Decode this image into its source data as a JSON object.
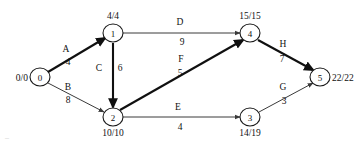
{
  "diagram": {
    "type": "aoa-network",
    "colors": {
      "background": "#ffffff",
      "node_stroke": "#1a1a1a",
      "edge_normal": "#3a3a3a",
      "edge_critical": "#101010",
      "text": "#111111"
    },
    "nodes": [
      {
        "id": "0",
        "label": "0",
        "time": "0/0",
        "cx": 40,
        "cy": 77,
        "r": 9,
        "time_pos": "left"
      },
      {
        "id": "1",
        "label": "1",
        "time": "4/4",
        "cx": 113,
        "cy": 33,
        "r": 9,
        "time_pos": "top"
      },
      {
        "id": "2",
        "label": "2",
        "time": "10/10",
        "cx": 113,
        "cy": 117,
        "r": 9,
        "time_pos": "bottom"
      },
      {
        "id": "3",
        "label": "3",
        "time": "14/19",
        "cx": 250,
        "cy": 117,
        "r": 9,
        "time_pos": "bottom"
      },
      {
        "id": "4",
        "label": "4",
        "time": "15/15",
        "cx": 250,
        "cy": 33,
        "r": 9,
        "time_pos": "top"
      },
      {
        "id": "5",
        "label": "5",
        "time": "22/22",
        "cx": 320,
        "cy": 77,
        "r": 9,
        "time_pos": "right"
      }
    ],
    "edges": [
      {
        "id": "A",
        "name": "A",
        "duration": "4",
        "from": "0",
        "to": "1",
        "critical": true,
        "x1": 48,
        "y1": 72,
        "x2": 105,
        "y2": 38,
        "name_x": 66,
        "name_y": 52,
        "dur_x": 68,
        "dur_y": 65
      },
      {
        "id": "B",
        "name": "B",
        "duration": "8",
        "from": "0",
        "to": "2",
        "critical": false,
        "x1": 48,
        "y1": 83,
        "x2": 104,
        "y2": 112,
        "name_x": 68,
        "name_y": 90,
        "dur_x": 68,
        "dur_y": 103
      },
      {
        "id": "C",
        "name": "C",
        "duration": "6",
        "from": "1",
        "to": "2",
        "critical": true,
        "x1": 113,
        "y1": 43,
        "x2": 113,
        "y2": 107,
        "name_x": 99,
        "name_y": 71,
        "dur_x": 120,
        "dur_y": 71
      },
      {
        "id": "D",
        "name": "D",
        "duration": "9",
        "from": "1",
        "to": "4",
        "critical": false,
        "x1": 123,
        "y1": 33,
        "x2": 240,
        "y2": 33,
        "name_x": 180,
        "name_y": 25,
        "dur_x": 182,
        "dur_y": 45
      },
      {
        "id": "E",
        "name": "E",
        "duration": "4",
        "from": "2",
        "to": "3",
        "critical": false,
        "x1": 123,
        "y1": 117,
        "x2": 240,
        "y2": 117,
        "name_x": 178,
        "name_y": 110,
        "dur_x": 180,
        "dur_y": 130
      },
      {
        "id": "F",
        "name": "F",
        "duration": "5",
        "from": "2",
        "to": "4",
        "critical": true,
        "x1": 120,
        "y1": 110,
        "x2": 243,
        "y2": 40,
        "name_x": 181,
        "name_y": 62,
        "dur_x": 180,
        "dur_y": 76
      },
      {
        "id": "G",
        "name": "G",
        "duration": "3",
        "from": "3",
        "to": "5",
        "critical": false,
        "x1": 259,
        "y1": 112,
        "x2": 313,
        "y2": 83,
        "name_x": 283,
        "name_y": 90,
        "dur_x": 284,
        "dur_y": 104
      },
      {
        "id": "H",
        "name": "H",
        "duration": "7",
        "from": "4",
        "to": "5",
        "critical": true,
        "x1": 258,
        "y1": 40,
        "x2": 313,
        "y2": 70,
        "name_x": 283,
        "name_y": 47,
        "dur_x": 282,
        "dur_y": 62
      }
    ],
    "artifact_text": "–"
  }
}
